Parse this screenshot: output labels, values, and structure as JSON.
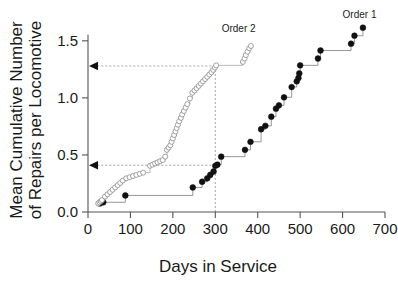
{
  "chart_data": {
    "type": "line",
    "title": "",
    "xlabel": "Days in Service",
    "ylabel": "Mean Cumulative Number of Repairs per Locomotive",
    "ylabel_line1": "Mean Cumulative Number",
    "ylabel_line2": "of Repairs per Locomotive",
    "xlim": [
      0,
      700
    ],
    "ylim": [
      0.0,
      1.7
    ],
    "xticks": [
      0,
      100,
      200,
      300,
      400,
      500,
      600,
      700
    ],
    "xtick_labels": [
      "0",
      "100",
      "200",
      "300",
      "400",
      "500",
      "600",
      "700"
    ],
    "yticks": [
      0.0,
      0.5,
      1.0,
      1.5
    ],
    "ytick_labels": [
      "0.0",
      "0.5",
      "1.0",
      "1.5"
    ],
    "grid": false,
    "legend_position": "inline-annotations",
    "annotations": [
      {
        "name": "order-1-label",
        "text": "Order 1",
        "x": 640,
        "y": 1.7
      },
      {
        "name": "order-2-label",
        "text": "Order 2",
        "x": 355,
        "y": 1.58
      }
    ],
    "reference_lines": [
      {
        "name": "ref-line-upper",
        "type": "horizontal-arrow",
        "y": 1.28,
        "from_x": 300,
        "to_x": 0,
        "style": "dotted",
        "arrow": "left"
      },
      {
        "name": "ref-line-lower",
        "type": "horizontal-arrow",
        "y": 0.41,
        "from_x": 300,
        "to_x": 0,
        "style": "dotted",
        "arrow": "left"
      },
      {
        "name": "ref-line-vertical",
        "type": "vertical",
        "x": 300,
        "from_y": 0.0,
        "to_y": 1.28,
        "style": "dotted"
      }
    ],
    "series": [
      {
        "name": "Order 1",
        "marker": "filled-circle",
        "color": "#111111",
        "points": [
          [
            28,
            0.075
          ],
          [
            36,
            0.085
          ],
          [
            88,
            0.145
          ],
          [
            247,
            0.215
          ],
          [
            269,
            0.265
          ],
          [
            281,
            0.295
          ],
          [
            288,
            0.325
          ],
          [
            296,
            0.355
          ],
          [
            300,
            0.405
          ],
          [
            305,
            0.415
          ],
          [
            314,
            0.485
          ],
          [
            370,
            0.545
          ],
          [
            383,
            0.615
          ],
          [
            408,
            0.725
          ],
          [
            418,
            0.755
          ],
          [
            432,
            0.835
          ],
          [
            443,
            0.905
          ],
          [
            450,
            0.935
          ],
          [
            462,
            1.005
          ],
          [
            480,
            1.095
          ],
          [
            492,
            1.145
          ],
          [
            496,
            1.175
          ],
          [
            498,
            1.215
          ],
          [
            500,
            1.285
          ],
          [
            542,
            1.345
          ],
          [
            548,
            1.415
          ],
          [
            620,
            1.475
          ],
          [
            628,
            1.545
          ],
          [
            648,
            1.615
          ]
        ]
      },
      {
        "name": "Order 2",
        "marker": "open-circle",
        "color": "#8a8a8a",
        "points": [
          [
            24,
            0.075
          ],
          [
            27,
            0.085
          ],
          [
            30,
            0.095
          ],
          [
            33,
            0.105
          ],
          [
            40,
            0.135
          ],
          [
            46,
            0.155
          ],
          [
            52,
            0.175
          ],
          [
            58,
            0.195
          ],
          [
            64,
            0.215
          ],
          [
            70,
            0.235
          ],
          [
            76,
            0.255
          ],
          [
            82,
            0.275
          ],
          [
            90,
            0.295
          ],
          [
            98,
            0.305
          ],
          [
            106,
            0.315
          ],
          [
            114,
            0.325
          ],
          [
            122,
            0.335
          ],
          [
            130,
            0.345
          ],
          [
            146,
            0.405
          ],
          [
            152,
            0.415
          ],
          [
            158,
            0.425
          ],
          [
            164,
            0.435
          ],
          [
            170,
            0.445
          ],
          [
            176,
            0.455
          ],
          [
            182,
            0.485
          ],
          [
            186,
            0.545
          ],
          [
            190,
            0.565
          ],
          [
            194,
            0.585
          ],
          [
            197,
            0.615
          ],
          [
            200,
            0.645
          ],
          [
            203,
            0.675
          ],
          [
            206,
            0.705
          ],
          [
            209,
            0.735
          ],
          [
            212,
            0.765
          ],
          [
            215,
            0.795
          ],
          [
            219,
            0.825
          ],
          [
            222,
            0.855
          ],
          [
            226,
            0.885
          ],
          [
            230,
            0.915
          ],
          [
            234,
            0.945
          ],
          [
            240,
            0.995
          ],
          [
            246,
            1.045
          ],
          [
            251,
            1.065
          ],
          [
            256,
            1.085
          ],
          [
            261,
            1.105
          ],
          [
            266,
            1.125
          ],
          [
            271,
            1.145
          ],
          [
            276,
            1.165
          ],
          [
            281,
            1.185
          ],
          [
            286,
            1.205
          ],
          [
            291,
            1.225
          ],
          [
            295,
            1.245
          ],
          [
            299,
            1.265
          ],
          [
            302,
            1.285
          ],
          [
            365,
            1.315
          ],
          [
            369,
            1.345
          ],
          [
            372,
            1.375
          ],
          [
            376,
            1.405
          ],
          [
            380,
            1.435
          ],
          [
            384,
            1.455
          ]
        ]
      }
    ]
  }
}
